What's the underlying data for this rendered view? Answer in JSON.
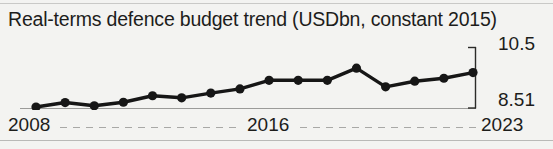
{
  "chart_data": {
    "type": "line",
    "title": "Real-terms defence budget trend (USDbn, constant 2015)",
    "xlabel": "",
    "ylabel": "",
    "ylim": [
      8.51,
      10.5
    ],
    "grid": false,
    "legend": null,
    "x": [
      2008,
      2009,
      2010,
      2011,
      2012,
      2013,
      2014,
      2015,
      2016,
      2017,
      2018,
      2019,
      2020,
      2021,
      2022,
      2023
    ],
    "values": [
      8.51,
      8.66,
      8.55,
      8.67,
      8.89,
      8.82,
      8.98,
      9.12,
      9.41,
      9.41,
      9.41,
      9.82,
      9.19,
      9.38,
      9.48,
      9.67
    ],
    "series": [
      {
        "name": "Real-terms defence budget",
        "values": [
          8.51,
          8.66,
          8.55,
          8.67,
          8.89,
          8.82,
          8.98,
          9.12,
          9.41,
          9.41,
          9.41,
          9.82,
          9.19,
          9.38,
          9.48,
          9.67
        ]
      }
    ],
    "y_tick_labels": [
      "8.51",
      "10.5"
    ],
    "x_tick_labels": [
      "2008",
      "2016",
      "2023"
    ],
    "marker_color": "#161616",
    "line_color": "#161616"
  },
  "axes": {
    "y": {
      "top_label": "10.5",
      "bottom_label": "8.51"
    },
    "x": {
      "ticks": [
        {
          "label": "2008"
        },
        {
          "label": "2016"
        },
        {
          "label": "2023"
        }
      ]
    }
  },
  "colors": {
    "background": "#f3f3f1",
    "text": "#1d1d1b",
    "line": "#161616",
    "axis": "#9b9b99",
    "rule": "#c9c9c7"
  }
}
